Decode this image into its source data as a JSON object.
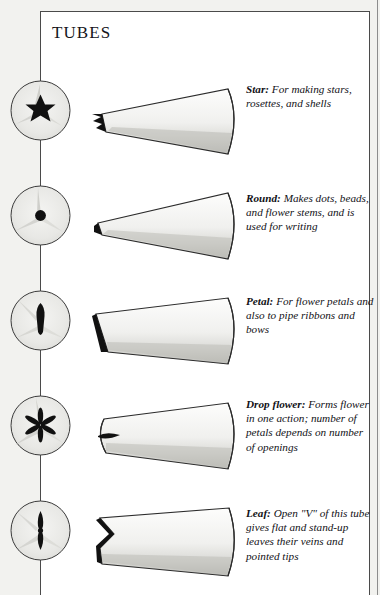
{
  "page": {
    "title": "TUBES",
    "background_color": "#f2f2ef",
    "card_color": "#ffffff",
    "ink_color": "#15151a"
  },
  "tubes": [
    {
      "name": "Star",
      "term": "Star:",
      "description": "For making stars, rosettes, and shells",
      "tip_icon": "six-point-star-opening",
      "tube_icon": "star-tube-cone"
    },
    {
      "name": "Round",
      "term": "Round:",
      "description": "Makes dots, beads, and flower stems, and is used for writing",
      "tip_icon": "round-dot-opening",
      "tube_icon": "round-tube-cone"
    },
    {
      "name": "Petal",
      "term": "Petal:",
      "description": "For flower petals and also to pipe ribbons and bows",
      "tip_icon": "teardrop-slit-opening",
      "tube_icon": "petal-tube-wedge"
    },
    {
      "name": "Drop flower",
      "term": "Drop flower:",
      "description": "Forms flower in one action; number of petals depends on number of openings",
      "tip_icon": "six-petal-flower-opening",
      "tube_icon": "drop-flower-tube-cone"
    },
    {
      "name": "Leaf",
      "term": "Leaf:",
      "description": "Open \"V\" of this tube gives flat and stand-up leaves their veins and pointed tips",
      "tip_icon": "v-slot-opening",
      "tube_icon": "leaf-tube-cone"
    }
  ]
}
